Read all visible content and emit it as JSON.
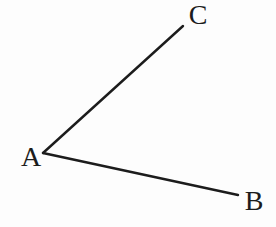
{
  "figure": {
    "background": "#fdfdfd",
    "line_color": "#1c1c1c",
    "text_color": "#1c1c1c",
    "line_width": 2.4,
    "font_size": 28,
    "vertex": {
      "label": "A",
      "x": 43,
      "y": 153
    },
    "rays": [
      {
        "name": "ray-AC",
        "from": "A",
        "to": "C",
        "x1": 43,
        "y1": 153,
        "x2": 183,
        "y2": 26
      },
      {
        "name": "ray-AB",
        "from": "A",
        "to": "B",
        "x1": 43,
        "y1": 153,
        "x2": 238,
        "y2": 195
      }
    ],
    "labels": [
      {
        "name": "label-A",
        "text": "A",
        "x": 31,
        "y": 166
      },
      {
        "name": "label-C",
        "text": "C",
        "x": 198,
        "y": 24
      },
      {
        "name": "label-B",
        "text": "B",
        "x": 254,
        "y": 210
      }
    ]
  }
}
